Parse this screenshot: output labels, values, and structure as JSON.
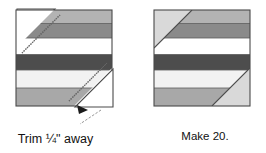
{
  "figure": {
    "type": "quilting-block-assembly-diagram",
    "title": "",
    "blocks": [
      {
        "id": "block-left",
        "role": "trim-step",
        "description": "Striped square block with two opposite corner triangles folded out for trimming",
        "x": 16,
        "y": 10,
        "width": 96,
        "height": 96,
        "stripes": [
          {
            "name": "stripe-1-medium-gray",
            "color": "#b3b3b3",
            "height_pct": 14
          },
          {
            "name": "stripe-2-dark-gray",
            "color": "#8a8a8a",
            "height_pct": 15
          },
          {
            "name": "stripe-3-white",
            "color": "#ffffff",
            "height_pct": 17
          },
          {
            "name": "stripe-4-charcoal",
            "color": "#4d4d4d",
            "height_pct": 16
          },
          {
            "name": "stripe-5-offwhite",
            "color": "#f2f2f2",
            "height_pct": 19
          },
          {
            "name": "stripe-6-medium-gray",
            "color": "#a8a8a8",
            "height_pct": 19
          }
        ],
        "corner_triangles": [
          {
            "name": "corner-triangle-top-left",
            "position": "top-left"
          },
          {
            "name": "corner-triangle-bottom-right",
            "position": "bottom-right"
          }
        ]
      },
      {
        "id": "block-right",
        "role": "finished-block",
        "description": "Finished striped square block with trimmed corners replaced by light triangles",
        "x": 154,
        "y": 10,
        "width": 96,
        "height": 96,
        "stripes": [
          {
            "name": "stripe-1-medium-gray",
            "color": "#b3b3b3",
            "height_pct": 14
          },
          {
            "name": "stripe-2-dark-gray",
            "color": "#8a8a8a",
            "height_pct": 15
          },
          {
            "name": "stripe-3-white",
            "color": "#ffffff",
            "height_pct": 17
          },
          {
            "name": "stripe-4-charcoal",
            "color": "#4d4d4d",
            "height_pct": 16
          },
          {
            "name": "stripe-5-offwhite",
            "color": "#f2f2f2",
            "height_pct": 19
          },
          {
            "name": "stripe-6-medium-gray",
            "color": "#a8a8a8",
            "height_pct": 19
          }
        ],
        "corner_triangles": [
          {
            "name": "corner-triangle-top-left",
            "position": "top-left",
            "color": "#d9d9d9"
          },
          {
            "name": "corner-triangle-bottom-right",
            "position": "bottom-right",
            "color": "#d9d9d9"
          }
        ]
      }
    ],
    "annotations": {
      "trim_caption_line1": "Trim ¼\" away",
      "trim_caption_line2": "from seam.",
      "make_caption": "Make 20.",
      "arrow": {
        "name": "trim-pointer-arrow",
        "points_to": "bottom-right-seam-line"
      }
    },
    "colors": {
      "outline": "#4a4a4a",
      "seam_line": "#666666",
      "text": "#111111",
      "page_background": "#ffffff"
    }
  }
}
